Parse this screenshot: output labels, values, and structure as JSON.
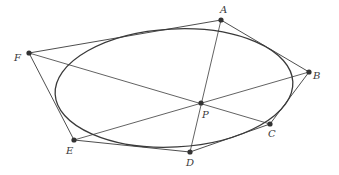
{
  "diagram": {
    "colors": {
      "stroke": "#3a3a3a",
      "point": "#333333",
      "background": "#ffffff"
    },
    "ellipse": {
      "cx": 174,
      "cy": 88,
      "rx": 119,
      "ry": 59,
      "rotation": -3
    },
    "points": [
      {
        "id": "A",
        "label": "A",
        "x": 221,
        "y": 20,
        "lx": 220,
        "ly": 13
      },
      {
        "id": "B",
        "label": "B",
        "x": 309,
        "y": 72,
        "lx": 313,
        "ly": 79
      },
      {
        "id": "C",
        "label": "C",
        "x": 270,
        "y": 124,
        "lx": 268,
        "ly": 137
      },
      {
        "id": "D",
        "label": "D",
        "x": 190,
        "y": 152,
        "lx": 186,
        "ly": 166
      },
      {
        "id": "E",
        "label": "E",
        "x": 74,
        "y": 140,
        "lx": 66,
        "ly": 154
      },
      {
        "id": "F",
        "label": "F",
        "x": 29,
        "y": 53,
        "lx": 14,
        "ly": 61
      },
      {
        "id": "P",
        "label": "P",
        "x": 201,
        "y": 103,
        "lx": 202,
        "ly": 118
      }
    ],
    "hexagon_edges": [
      [
        "A",
        "B"
      ],
      [
        "B",
        "C"
      ],
      [
        "C",
        "D"
      ],
      [
        "D",
        "E"
      ],
      [
        "E",
        "F"
      ],
      [
        "F",
        "A"
      ]
    ],
    "diagonals": [
      [
        "A",
        "D"
      ],
      [
        "B",
        "E"
      ],
      [
        "C",
        "F"
      ]
    ]
  }
}
